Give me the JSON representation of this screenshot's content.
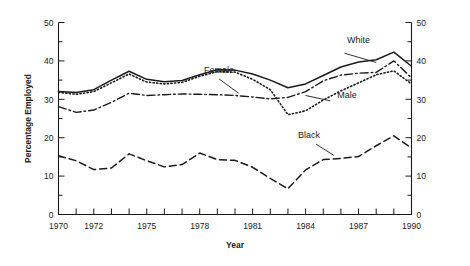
{
  "chart_data": {
    "type": "line",
    "title": "",
    "xlabel": "Year",
    "ylabel": "Percentage Employed",
    "xlim": [
      1970,
      1990
    ],
    "ylim": [
      0,
      50
    ],
    "ytick_labels": [
      "0",
      "10",
      "20",
      "30",
      "40",
      "50"
    ],
    "ytick_values": [
      0,
      10,
      20,
      30,
      40,
      50
    ],
    "yminor_values": [
      5,
      15,
      25,
      35,
      45
    ],
    "xtick_labels": [
      "1970",
      "1972",
      "1975",
      "1978",
      "1981",
      "1984",
      "1987",
      "1990"
    ],
    "xtick_label_values": [
      1970,
      1972,
      1975,
      1978,
      1981,
      1984,
      1987,
      1990
    ],
    "x": [
      1970,
      1971,
      1972,
      1973,
      1974,
      1975,
      1976,
      1977,
      1978,
      1979,
      1980,
      1981,
      1982,
      1983,
      1984,
      1985,
      1986,
      1987,
      1988,
      1989,
      1990
    ],
    "grid": false,
    "legend_position": "inline-annotations",
    "dual_y_axis": true,
    "series": [
      {
        "name": "White",
        "style": "solid",
        "label_text": "White",
        "values": [
          32.0,
          31.8,
          32.5,
          35.0,
          37.3,
          35.2,
          34.6,
          34.9,
          36.4,
          37.7,
          37.6,
          36.6,
          35.0,
          33.0,
          34.0,
          36.2,
          38.4,
          39.7,
          40.3,
          42.3,
          38.6
        ]
      },
      {
        "name": "Female",
        "style": "dash-dot",
        "label_text": "Female",
        "values": [
          28.1,
          26.6,
          27.2,
          29.2,
          31.6,
          31.0,
          31.2,
          31.4,
          31.3,
          31.2,
          31.0,
          30.6,
          30.1,
          30.5,
          32.0,
          34.8,
          36.3,
          36.8,
          37.0,
          40.0,
          35.6
        ]
      },
      {
        "name": "Male",
        "style": "dotted",
        "label_text": "Male",
        "values": [
          31.8,
          31.3,
          32.0,
          34.3,
          36.6,
          34.5,
          34.0,
          34.4,
          36.0,
          37.2,
          37.1,
          35.2,
          32.5,
          26.0,
          27.0,
          29.8,
          32.2,
          34.3,
          36.4,
          37.4,
          34.0
        ]
      },
      {
        "name": "Black",
        "style": "dashed",
        "label_text": "Black",
        "values": [
          15.3,
          14.0,
          11.7,
          12.1,
          15.8,
          14.0,
          12.4,
          13.0,
          16.0,
          14.3,
          14.1,
          12.3,
          9.4,
          6.7,
          11.6,
          14.3,
          14.6,
          15.1,
          17.9,
          20.5,
          17.3
        ]
      }
    ],
    "annotations": [
      {
        "text": "White",
        "x": 1987.0,
        "y": 44.0
      },
      {
        "text": "Female",
        "x": 1979.6,
        "y": 36.6
      },
      {
        "text": "Male",
        "x": 1986.5,
        "y": 30.5
      },
      {
        "text": "Black",
        "x": 1985.0,
        "y": 19.5
      }
    ]
  }
}
